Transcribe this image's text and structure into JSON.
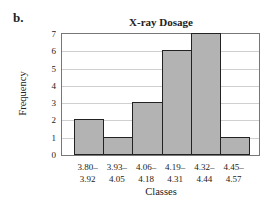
{
  "part_label": "b.",
  "chart_data": {
    "type": "bar",
    "title": "X-ray Dosage",
    "xlabel": "Classes",
    "ylabel": "Frequency",
    "categories": [
      "3.80–3.92",
      "3.93–4.05",
      "4.06–4.18",
      "4.19–4.31",
      "4.32–4.44",
      "4.45–4.57"
    ],
    "category_lines": [
      [
        "3.80–",
        "3.92"
      ],
      [
        "3.93–",
        "4.05"
      ],
      [
        "4.06–",
        "4.18"
      ],
      [
        "4.19–",
        "4.31"
      ],
      [
        "4.32–",
        "4.44"
      ],
      [
        "4.45–",
        "4.57"
      ]
    ],
    "values": [
      2,
      1,
      3,
      6,
      7,
      1
    ],
    "ylim": [
      0,
      7
    ],
    "yticks": [
      "0",
      "1",
      "2",
      "3",
      "4",
      "5",
      "6",
      "7"
    ],
    "grid": true,
    "legend": null,
    "bar_color": "#b3b3b3"
  }
}
